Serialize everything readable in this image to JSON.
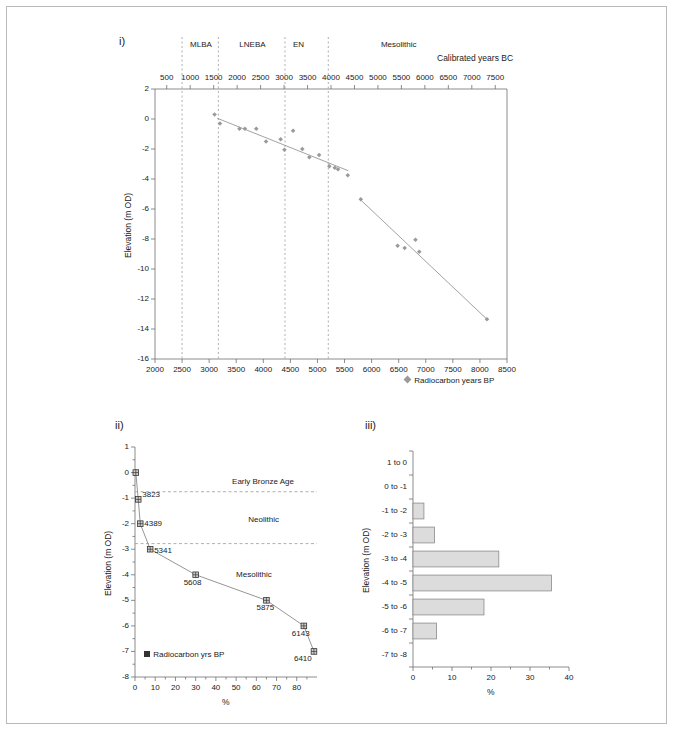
{
  "figure": {
    "panels": [
      "i)",
      "ii)",
      "iii)"
    ]
  },
  "panel_i": {
    "tag": "i)",
    "top_axis_title": "Calibrated years BC",
    "bottom_axis_title": "",
    "y_axis_title": "Elevation (m OD)",
    "legend": "Radiocarbon years BP",
    "legend_marker": "diamond-marker",
    "top_ticks": [
      500,
      1000,
      1500,
      2000,
      2500,
      3000,
      3500,
      4000,
      4500,
      5000,
      5500,
      6000,
      6500,
      7000,
      7500
    ],
    "bottom_ticks": [
      2000,
      2500,
      3000,
      3500,
      4000,
      4500,
      5000,
      5500,
      6000,
      6500,
      7000,
      7500,
      8000,
      8500
    ],
    "y_ticks": [
      2,
      0,
      -2,
      -4,
      -6,
      -8,
      -10,
      -12,
      -14,
      -16
    ],
    "periods": [
      {
        "label": "MLBA",
        "center_bp": 2850
      },
      {
        "label": "LNEBA",
        "center_bp": 3800
      },
      {
        "label": "EN",
        "center_bp": 4650
      },
      {
        "label": "Mesolithic",
        "center_bp": 6500
      }
    ],
    "period_boundaries_bp": [
      2500,
      3170,
      4400,
      5200
    ]
  },
  "panel_ii": {
    "tag": "ii)",
    "x_axis_title": "%",
    "y_axis_title": "Elevation (m OD)",
    "legend": "Radiocarbon yrs BP",
    "legend_marker": "square-marker",
    "x_ticks": [
      0,
      10,
      20,
      30,
      40,
      50,
      60,
      70,
      80
    ],
    "y_ticks": [
      1,
      0,
      -1,
      -2,
      -3,
      -4,
      -5,
      -6,
      -7,
      -8
    ],
    "era_labels": [
      "Early Bronze Age",
      "Neolithic",
      "Mesolithic"
    ],
    "era_boundaries_elev": [
      -0.75,
      -2.78
    ]
  },
  "panel_iii": {
    "tag": "iii)",
    "x_axis_title": "%",
    "y_axis_title": "Elevation (m OD)",
    "x_ticks": [
      0,
      10,
      20,
      30,
      40
    ]
  },
  "colors": {
    "frame": "#b9b9b9",
    "axis": "#6f6f6f",
    "marker_i": "#9a9a9a",
    "trend_line": "#8a8a8a",
    "dashed_guide": "#9a9a9a",
    "bar_fill": "#dcdcdc",
    "bar_stroke": "#8a8a8a",
    "marker_ii": "#333333",
    "text": "#1a1a1a"
  },
  "chart_data": [
    {
      "id": "panel-i",
      "type": "scatter",
      "title": "",
      "xlabel": "Radiocarbon years BP",
      "xlabel_top": "Calibrated years BC",
      "ylabel": "Elevation (m OD)",
      "xlim": [
        2000,
        8500
      ],
      "ylim": [
        -16,
        2
      ],
      "xlim_top": [
        250,
        7750
      ],
      "grid": false,
      "legend": "Radiocarbon years BP",
      "legend_position": "bottom-right",
      "series": [
        {
          "name": "Radiocarbon years BP",
          "x": [
            3100,
            3200,
            3560,
            3660,
            3870,
            4050,
            4320,
            4390,
            4550,
            4720,
            4850,
            5030,
            5220,
            5320,
            5380,
            5560,
            5800,
            6480,
            6610,
            6810,
            6880,
            8130
          ],
          "y": [
            0.3,
            -0.3,
            -0.65,
            -0.65,
            -0.65,
            -1.5,
            -1.35,
            -2.05,
            -0.78,
            -2.0,
            -2.55,
            -2.4,
            -3.15,
            -3.25,
            -3.35,
            -3.75,
            -5.35,
            -8.45,
            -8.6,
            -8.05,
            -8.85,
            -13.35
          ]
        }
      ],
      "trend_lines": [
        {
          "name": "neolithic-bronze-trend",
          "x": [
            3150,
            5570
          ],
          "y": [
            0.05,
            -3.45
          ]
        },
        {
          "name": "mesolithic-trend",
          "x": [
            5800,
            8130
          ],
          "y": [
            -5.4,
            -13.35
          ]
        }
      ],
      "vertical_guides": [
        {
          "label": "MLBA-LNEBA-left",
          "x": 2500
        },
        {
          "label": "MLBA-LNEBA",
          "x": 3170
        },
        {
          "label": "LNEBA-EN",
          "x": 4400
        },
        {
          "label": "EN-Mesolithic",
          "x": 5200
        }
      ],
      "period_bands": [
        {
          "label": "MLBA",
          "x_center": 2850
        },
        {
          "label": "LNEBA",
          "x_center": 3800
        },
        {
          "label": "EN",
          "x_center": 4650
        },
        {
          "label": "Mesolithic",
          "x_center": 6500
        }
      ]
    },
    {
      "id": "panel-ii",
      "type": "line",
      "title": "",
      "xlabel": "%",
      "ylabel": "Elevation (m OD)",
      "xlim": [
        0,
        90
      ],
      "ylim": [
        -8,
        1
      ],
      "grid": false,
      "legend": "Radiocarbon yrs BP",
      "legend_position": "bottom-left",
      "series": [
        {
          "name": "Radiocarbon yrs BP",
          "x": [
            0.4,
            1.6,
            2.6,
            7.5,
            30.0,
            65.0,
            83.5,
            88.5
          ],
          "y": [
            0.0,
            -1.05,
            -2.0,
            -3.0,
            -4.0,
            -5.0,
            -6.0,
            -7.0
          ],
          "labels": [
            "",
            "3823",
            "4389",
            "5341",
            "5608",
            "5875",
            "6143",
            "6410"
          ]
        }
      ],
      "horizontal_guides": [
        {
          "label": "Early Bronze Age / Neolithic",
          "y": -0.75
        },
        {
          "label": "Neolithic / Mesolithic",
          "y": -2.78
        }
      ],
      "annotations": [
        {
          "text": "Early Bronze Age",
          "x": 48,
          "y": -0.35
        },
        {
          "text": "Neolithic",
          "x": 56,
          "y": -1.85
        },
        {
          "text": "Mesolithic",
          "x": 50,
          "y": -4.0
        }
      ]
    },
    {
      "id": "panel-iii",
      "type": "bar",
      "orientation": "horizontal",
      "title": "",
      "xlabel": "%",
      "ylabel": "Elevation (m OD)",
      "categories": [
        "1 to 0",
        "0 to -1",
        "-1 to -2",
        "-2 to -3",
        "-3 to -4",
        "-4 to -5",
        "-5 to -6",
        "-6 to -7",
        "-7 to -8"
      ],
      "values": [
        0,
        0,
        2.8,
        5.5,
        22.0,
        35.5,
        18.2,
        6.0,
        0
      ],
      "xlim": [
        0,
        40
      ],
      "grid": false
    }
  ]
}
